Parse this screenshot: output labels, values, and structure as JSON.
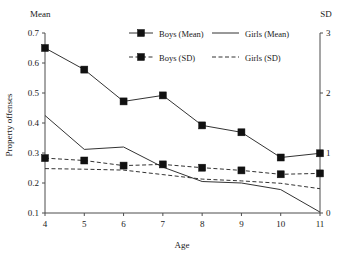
{
  "chart_data": {
    "type": "line",
    "title": "",
    "xlabel": "Age",
    "ylabel": "Property offenses",
    "x": [
      4,
      5,
      6,
      7,
      8,
      9,
      10,
      11
    ],
    "xtick_labels": [
      "4",
      "5",
      "6",
      "7",
      "8",
      "9",
      "10",
      "11"
    ],
    "xlim": [
      4,
      11
    ],
    "grid": false,
    "legend_position": "top-center",
    "left_axis": {
      "label": "Mean",
      "ylabel": "Property offenses",
      "ylim": [
        0.1,
        0.7
      ],
      "ticks": [
        0.1,
        0.2,
        0.3,
        0.4,
        0.5,
        0.6,
        0.7
      ],
      "tick_labels": [
        "0.1",
        "0.2",
        "0.3",
        "0.4",
        "0.5",
        "0.6",
        "0.7"
      ]
    },
    "right_axis": {
      "label": "SD",
      "ylim": [
        0,
        3
      ],
      "ticks": [
        0,
        1,
        2,
        3
      ],
      "tick_labels": [
        "0",
        "1",
        "2",
        "3"
      ]
    },
    "series": [
      {
        "name": "Boys (Mean)",
        "axis": "left",
        "style": "solid",
        "marker": "square",
        "values": [
          0.65,
          0.578,
          0.472,
          0.492,
          0.392,
          0.369,
          0.285,
          0.299
        ]
      },
      {
        "name": "Girls (Mean)",
        "axis": "left",
        "style": "solid",
        "marker": "none",
        "values": [
          0.425,
          0.312,
          0.32,
          0.253,
          0.205,
          0.2,
          0.178,
          0.103
        ]
      },
      {
        "name": "Boys (SD)",
        "axis": "right",
        "style": "dashed",
        "marker": "square",
        "values_left_scale": [
          0.283,
          0.275,
          0.258,
          0.262,
          0.251,
          0.242,
          0.229,
          0.232
        ],
        "values": [
          0.92,
          0.87,
          0.79,
          0.81,
          0.75,
          0.71,
          0.65,
          0.66
        ]
      },
      {
        "name": "Girls (SD)",
        "axis": "right",
        "style": "dashed",
        "marker": "none",
        "values_left_scale": [
          0.248,
          0.246,
          0.243,
          0.228,
          0.213,
          0.207,
          0.199,
          0.181
        ],
        "values": [
          0.74,
          0.73,
          0.72,
          0.64,
          0.57,
          0.54,
          0.5,
          0.41
        ]
      }
    ],
    "colors": {
      "line": "#333333",
      "marker": "#111111",
      "axis": "#4d4d4d",
      "text": "#1a1a1a",
      "background": "#ffffff"
    }
  },
  "legend": {
    "entries": [
      {
        "label": "Boys (Mean)"
      },
      {
        "label": "Girls (Mean)"
      },
      {
        "label": "Boys (SD)"
      },
      {
        "label": "Girls (SD)"
      }
    ]
  }
}
